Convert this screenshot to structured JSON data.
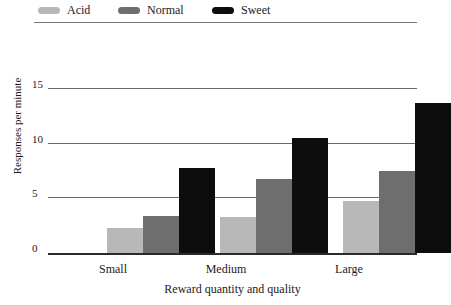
{
  "chart_data": {
    "type": "bar",
    "title": "",
    "xlabel": "Reward quantity and quality",
    "ylabel": "Responses per minute",
    "categories": [
      "Small",
      "Medium",
      "Large"
    ],
    "series": [
      {
        "name": "Acid",
        "color": "#b8b8b8",
        "values": [
          2.3,
          3.3,
          4.8
        ]
      },
      {
        "name": "Normal",
        "color": "#6e6e6e",
        "values": [
          3.4,
          6.8,
          7.5
        ]
      },
      {
        "name": "Sweet",
        "color": "#0d0d0d",
        "values": [
          7.8,
          10.5,
          13.7
        ]
      }
    ],
    "ylim": [
      0,
      16
    ],
    "yticks": [
      "0",
      "5",
      "10",
      "15"
    ],
    "ytick_values": [
      0,
      5,
      10,
      15
    ],
    "grid": true,
    "legend_position": "top-left"
  }
}
